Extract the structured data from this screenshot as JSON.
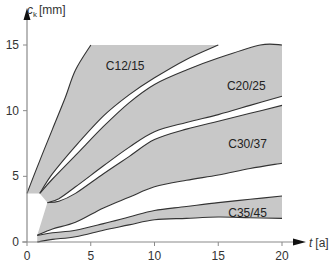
{
  "chart_data": {
    "type": "area",
    "title": "",
    "xlabel": "t [a]",
    "ylabel": "c_k [mm]",
    "xlabel_main": "t",
    "xlabel_unit": "[a]",
    "ylabel_main": "c",
    "ylabel_sub": "k",
    "ylabel_unit": "[mm]",
    "xlim": [
      0,
      20
    ],
    "ylim": [
      0,
      15
    ],
    "xticks": [
      0,
      5,
      10,
      15,
      20
    ],
    "yticks": [
      0,
      5,
      10,
      15
    ],
    "grid": false,
    "legend": "none",
    "colors": {
      "band_fill": "#c8c8c8",
      "curve": "#333333",
      "axis": "#8a8a8a"
    },
    "bands": [
      {
        "name": "C12/15",
        "label_pos": [
          7.7,
          13.4
        ],
        "upper": [
          [
            0,
            3.7
          ],
          [
            1,
            6.2
          ],
          [
            2,
            8.6
          ],
          [
            3,
            11.0
          ],
          [
            3.8,
            13.1
          ],
          [
            5,
            15
          ]
        ],
        "lower": [
          [
            1,
            3.7
          ],
          [
            2,
            5.2
          ],
          [
            3.8,
            7.3
          ],
          [
            6,
            9.6
          ],
          [
            8,
            11.2
          ],
          [
            10,
            12.5
          ],
          [
            12.5,
            13.9
          ],
          [
            15,
            15
          ]
        ]
      },
      {
        "name": "C20/25",
        "label_pos": [
          17.2,
          11.9
        ],
        "upper": [
          [
            1,
            3.7
          ],
          [
            2,
            4.8
          ],
          [
            3.8,
            6.6
          ],
          [
            6,
            8.8
          ],
          [
            8,
            10.6
          ],
          [
            10,
            12.0
          ],
          [
            12.5,
            13.1
          ],
          [
            15,
            14.0
          ],
          [
            18.3,
            15
          ],
          [
            20,
            15
          ]
        ],
        "lower": [
          [
            1.6,
            3.0
          ],
          [
            2.5,
            3.3
          ],
          [
            3.8,
            4.2
          ],
          [
            6,
            5.8
          ],
          [
            8,
            7.2
          ],
          [
            10,
            8.4
          ],
          [
            12.5,
            9.1
          ],
          [
            15,
            9.7
          ],
          [
            17.5,
            10.4
          ],
          [
            20,
            11.1
          ]
        ]
      },
      {
        "name": "C30/37",
        "label_pos": [
          17.3,
          7.5
        ],
        "upper": [
          [
            1.6,
            3.0
          ],
          [
            2.5,
            3.1
          ],
          [
            3.8,
            3.7
          ],
          [
            6,
            5.2
          ],
          [
            8,
            6.5
          ],
          [
            10,
            7.8
          ],
          [
            12.5,
            8.6
          ],
          [
            15,
            9.2
          ],
          [
            17.5,
            9.8
          ],
          [
            20,
            10.4
          ]
        ],
        "lower": [
          [
            0.8,
            0.5
          ],
          [
            2,
            1.0
          ],
          [
            3.8,
            1.5
          ],
          [
            6,
            2.6
          ],
          [
            8,
            3.4
          ],
          [
            10,
            4.2
          ],
          [
            12.5,
            4.7
          ],
          [
            15,
            5.1
          ],
          [
            17.5,
            5.6
          ],
          [
            20,
            6.0
          ]
        ]
      },
      {
        "name": "C35/45",
        "label_pos": [
          17.3,
          2.2
        ],
        "upper": [
          [
            0.8,
            0.5
          ],
          [
            2,
            0.7
          ],
          [
            3.8,
            0.9
          ],
          [
            6,
            1.4
          ],
          [
            8,
            1.9
          ],
          [
            10,
            2.4
          ],
          [
            12.5,
            2.7
          ],
          [
            15,
            3.0
          ],
          [
            17.5,
            3.25
          ],
          [
            20,
            3.5
          ]
        ],
        "lower": [
          [
            0.8,
            0.0
          ],
          [
            2,
            0.2
          ],
          [
            3.8,
            0.4
          ],
          [
            6,
            0.9
          ],
          [
            8,
            1.3
          ],
          [
            10,
            1.7
          ],
          [
            12.5,
            1.8
          ],
          [
            15,
            1.9
          ],
          [
            17.5,
            1.85
          ],
          [
            20,
            1.8
          ]
        ]
      }
    ]
  }
}
